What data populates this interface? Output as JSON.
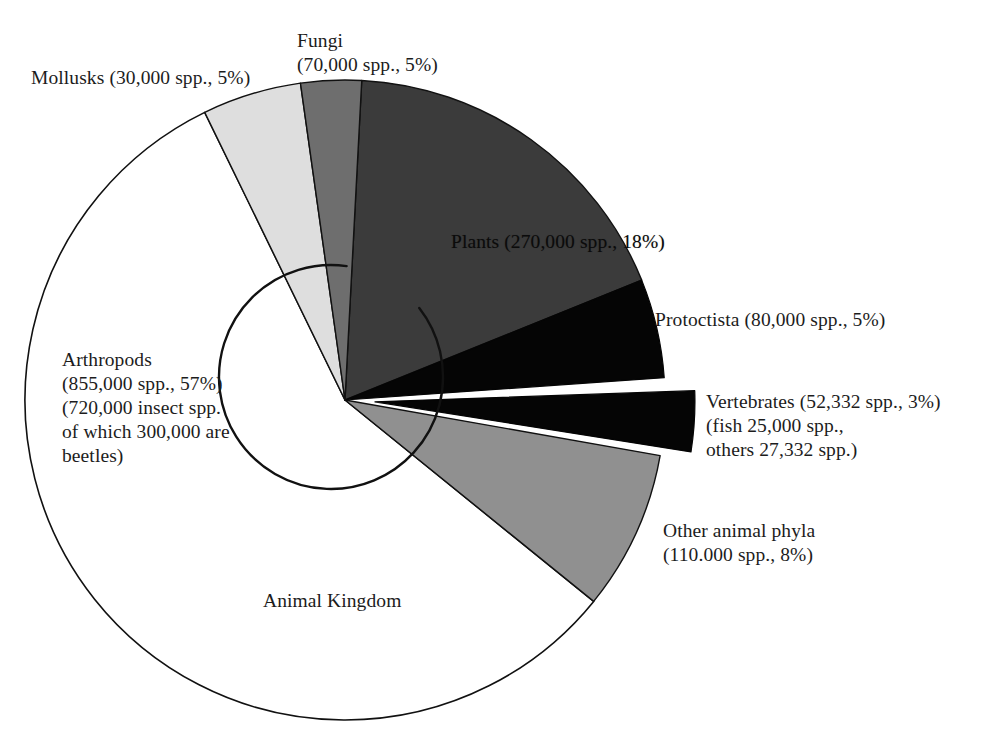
{
  "figure": {
    "title": "",
    "background_color": "#ffffff",
    "text_color": "#1c1c1c"
  },
  "labels": {
    "fungi": "Fungi\n(70,000 spp., 5%)",
    "mollusks": "Mollusks (30,000 spp., 5%)",
    "plants": "Plants (270,000 spp., 18%)",
    "protoctista": "Protoctista (80,000 spp., 5%)",
    "vertebrates": "Vertebrates (52,332 spp., 3%)\n(fish 25,000 spp.,\nothers 27,332 spp.)",
    "arthropods": "Arthropods\n(855,000 spp., 57%)\n(720,000 insect spp.\nof which 300,000 are\nbeetles)",
    "other_animal_phyla": "Other animal phyla\n(110.000 spp., 8%)",
    "animal_kingdom": "Animal Kingdom"
  },
  "chart_data": {
    "type": "pie",
    "title": "",
    "subtitle": "",
    "xlabel": "",
    "ylabel": "",
    "legend_position": "none",
    "grid": false,
    "total_species": 1467332,
    "units": "species (spp.)",
    "start_angle_deg": 0,
    "direction": "clockwise",
    "center": {
      "x": 345,
      "y": 400
    },
    "radius": 320,
    "inner_arc": {
      "name": "Arthropods inner boundary arc",
      "center": {
        "x": 331,
        "y": 377
      },
      "radius": 112,
      "stroke": "#111111"
    },
    "categories": [
      "Plants",
      "Protoctista",
      "Vertebrates",
      "Other animal phyla",
      "Arthropods",
      "Mollusks",
      "Fungi"
    ],
    "values": [
      18,
      5,
      3,
      8,
      57,
      5,
      5
    ],
    "species_counts": [
      270000,
      80000,
      52332,
      110000,
      855000,
      30000,
      70000
    ],
    "slices": [
      {
        "name": "Plants",
        "percent": 18,
        "species": 270000,
        "label": "Plants (270,000 spp., 18%)",
        "color": "#3b3b3b",
        "stroke": "#111111",
        "start_deg": 3,
        "end_deg": 68,
        "exploded": false,
        "label_placement": "inside"
      },
      {
        "name": "Protoctista",
        "percent": 5,
        "species": 80000,
        "label": "Protoctista (80,000 spp., 5%)",
        "color": "#050505",
        "stroke": "#050505",
        "start_deg": 68,
        "end_deg": 86,
        "exploded": false,
        "label_placement": "outside-right"
      },
      {
        "name": "Vertebrates",
        "percent": 3,
        "species": 52332,
        "label": "Vertebrates (52,332 spp., 3%)",
        "sub_label": "(fish 25,000 spp., others 27,332 spp.)",
        "fish_species": 25000,
        "other_vertebrate_species": 27332,
        "color": "#050505",
        "stroke": "#050505",
        "start_deg": 88,
        "end_deg": 99,
        "exploded": true,
        "explode_offset_px": 30,
        "label_placement": "outside-right"
      },
      {
        "name": "Other animal phyla",
        "percent": 8,
        "species": 110000,
        "label": "Other animal phyla (110.000 spp., 8%)",
        "color": "#909090",
        "stroke": "#111111",
        "start_deg": 100,
        "end_deg": 129,
        "exploded": false,
        "label_placement": "outside-right"
      },
      {
        "name": "Arthropods",
        "percent": 57,
        "species": 855000,
        "label": "Arthropods (855,000 spp., 57%)",
        "sub_label": "(720,000 insect spp. of which 300,000 are beetles)",
        "insect_species": 720000,
        "beetle_species": 300000,
        "color": "#ffffff",
        "stroke": "#111111",
        "start_deg": 129,
        "end_deg": 334,
        "exploded": false,
        "label_placement": "outside-left"
      },
      {
        "name": "Mollusks",
        "percent": 5,
        "species": 30000,
        "label": "Mollusks (30,000 spp., 5%)",
        "color": "#dedede",
        "stroke": "#111111",
        "start_deg": 334,
        "end_deg": 352,
        "exploded": false,
        "label_placement": "outside-left"
      },
      {
        "name": "Fungi",
        "percent": 5,
        "species": 70000,
        "label": "Fungi (70,000 spp., 5%)",
        "color": "#6e6e6e",
        "stroke": "#111111",
        "start_deg": 352,
        "end_deg": 3,
        "exploded": false,
        "label_placement": "outside-top"
      }
    ],
    "annotations": [
      {
        "name": "animal-kingdom",
        "text": "Animal Kingdom",
        "x": 340,
        "y": 600
      }
    ]
  }
}
